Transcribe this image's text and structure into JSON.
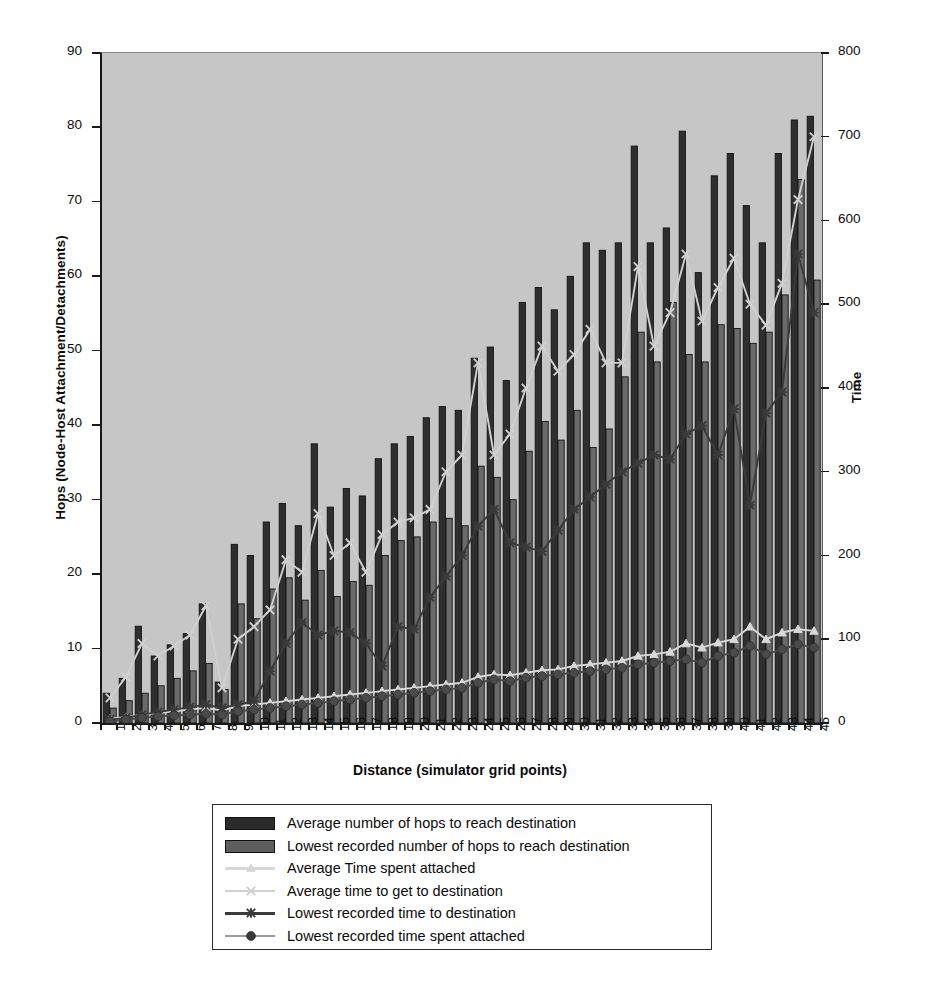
{
  "chart_data": {
    "type": "bar",
    "title": "",
    "subtitle": "",
    "xlabel": "Distance (simulator grid points)",
    "ylabel": "Hops (Node-Host Attachment/Detachments)",
    "y2label": "Time",
    "ylim": [
      0,
      90
    ],
    "y2lim": [
      0,
      800
    ],
    "yticks": [
      0,
      10,
      20,
      30,
      40,
      50,
      60,
      70,
      80,
      90
    ],
    "y2ticks": [
      0,
      100,
      200,
      300,
      400,
      500,
      600,
      700,
      800
    ],
    "grid": false,
    "legend_position": "below-plot",
    "plot_background": "#c6c6c6",
    "categories": [
      1,
      2,
      3,
      4,
      5,
      6,
      7,
      8,
      9,
      10,
      11,
      12,
      13,
      14,
      15,
      16,
      17,
      18,
      19,
      20,
      21,
      22,
      23,
      24,
      25,
      26,
      27,
      28,
      29,
      30,
      31,
      32,
      33,
      34,
      35,
      36,
      37,
      38,
      39,
      40,
      41,
      42,
      43,
      44,
      45
    ],
    "series": [
      {
        "name": "Average number of hops to reach destination",
        "kind": "bar",
        "axis": "left",
        "color": "#2b2b2b",
        "values": [
          4.0,
          6.0,
          13.0,
          9.0,
          10.5,
          12.0,
          16.0,
          5.5,
          24.0,
          22.5,
          27.0,
          29.5,
          26.5,
          37.5,
          29.0,
          31.5,
          30.5,
          35.5,
          37.5,
          38.5,
          41.0,
          42.5,
          42.0,
          49.0,
          50.5,
          46.0,
          56.5,
          58.5,
          55.5,
          60.0,
          64.5,
          63.5,
          64.5,
          77.5,
          64.5,
          66.5,
          79.5,
          60.5,
          73.5,
          76.5,
          69.5,
          64.5,
          76.5,
          81.0,
          81.5
        ]
      },
      {
        "name": "Lowest recorded number of hops to reach destination",
        "kind": "bar",
        "axis": "left",
        "color": "#5e5e5e",
        "values": [
          2.0,
          3.0,
          4.0,
          5.0,
          6.0,
          7.0,
          8.0,
          4.5,
          16.0,
          14.0,
          18.0,
          19.5,
          16.5,
          20.5,
          17.0,
          19.0,
          18.5,
          22.5,
          24.5,
          25.0,
          27.0,
          27.5,
          26.5,
          34.5,
          33.0,
          30.0,
          36.5,
          40.5,
          38.0,
          42.0,
          37.0,
          39.5,
          46.5,
          52.5,
          48.5,
          56.5,
          49.5,
          48.5,
          53.5,
          53.0,
          51.0,
          52.5,
          57.5,
          73.0,
          59.5
        ]
      },
      {
        "name": "Average Time spent attached",
        "kind": "line",
        "axis": "right",
        "marker": "triangle",
        "color": "#d8d8d8",
        "values": [
          5,
          7,
          10,
          12,
          14,
          16,
          18,
          15,
          20,
          22,
          24,
          26,
          28,
          30,
          32,
          34,
          36,
          38,
          40,
          42,
          44,
          46,
          48,
          55,
          58,
          57,
          60,
          63,
          64,
          68,
          70,
          72,
          74,
          80,
          82,
          85,
          95,
          90,
          96,
          100,
          115,
          100,
          108,
          112,
          110
        ]
      },
      {
        "name": "Average time to get to destination",
        "kind": "line",
        "axis": "right",
        "marker": "x",
        "color": "#d0d0d0",
        "values": [
          30,
          55,
          95,
          80,
          92,
          105,
          140,
          42,
          100,
          115,
          135,
          195,
          180,
          250,
          200,
          215,
          180,
          225,
          240,
          245,
          255,
          300,
          320,
          430,
          320,
          345,
          400,
          450,
          420,
          440,
          470,
          430,
          430,
          545,
          450,
          490,
          560,
          480,
          520,
          555,
          500,
          475,
          525,
          625,
          700
        ]
      },
      {
        "name": "Lowest recorded time to destination",
        "kind": "line",
        "axis": "right",
        "marker": "asterisk",
        "color": "#3a3a3a",
        "values": [
          4,
          6,
          10,
          13,
          16,
          19,
          22,
          18,
          22,
          26,
          62,
          95,
          120,
          105,
          110,
          108,
          95,
          68,
          115,
          112,
          150,
          175,
          200,
          235,
          255,
          215,
          210,
          205,
          230,
          255,
          270,
          285,
          300,
          310,
          320,
          315,
          345,
          355,
          320,
          375,
          260,
          370,
          395,
          560,
          490
        ]
      },
      {
        "name": "Lowest recorded time spent attached",
        "kind": "line",
        "axis": "right",
        "marker": "circle",
        "color": "#4a4a4a",
        "values": [
          2,
          4,
          6,
          8,
          9,
          10,
          11,
          10,
          14,
          16,
          18,
          20,
          22,
          24,
          26,
          28,
          30,
          32,
          34,
          36,
          38,
          40,
          42,
          48,
          52,
          50,
          54,
          56,
          58,
          60,
          62,
          64,
          66,
          70,
          72,
          74,
          76,
          72,
          80,
          84,
          92,
          82,
          88,
          94,
          90
        ]
      }
    ]
  },
  "axes": {
    "left": {
      "title": "Hops (Node-Host Attachment/Detachments)",
      "ticks": [
        "0",
        "10",
        "20",
        "30",
        "40",
        "50",
        "60",
        "70",
        "80",
        "90"
      ]
    },
    "right": {
      "title": "Time",
      "ticks": [
        "0",
        "100",
        "200",
        "300",
        "400",
        "500",
        "600",
        "700",
        "800"
      ]
    },
    "bottom": {
      "title": "Distance (simulator grid points)",
      "ticks": [
        "1",
        "2",
        "3",
        "4",
        "5",
        "6",
        "7",
        "8",
        "9",
        "10",
        "11",
        "12",
        "13",
        "14",
        "15",
        "16",
        "17",
        "18",
        "19",
        "20",
        "21",
        "22",
        "23",
        "24",
        "25",
        "26",
        "27",
        "28",
        "29",
        "30",
        "31",
        "32",
        "33",
        "34",
        "35",
        "36",
        "37",
        "38",
        "39",
        "40",
        "41",
        "42",
        "43",
        "44",
        "45"
      ]
    }
  },
  "legend": {
    "items": [
      {
        "label": "Average number of hops to reach destination",
        "key": "bar",
        "color": "#2b2b2b",
        "marker": "none"
      },
      {
        "label": "Lowest recorded number of hops to reach destination",
        "key": "bar",
        "color": "#5e5e5e",
        "marker": "none"
      },
      {
        "label": "Average Time spent attached",
        "key": "line",
        "color": "#d8d8d8",
        "marker": "triangle"
      },
      {
        "label": "Average time to get to destination",
        "key": "line",
        "color": "#d0d0d0",
        "marker": "x"
      },
      {
        "label": "Lowest recorded time to destination",
        "key": "line",
        "color": "#3a3a3a",
        "marker": "asterisk"
      },
      {
        "label": "Lowest recorded time spent attached",
        "key": "line",
        "color": "#9a9a9a",
        "marker": "circle"
      }
    ]
  }
}
